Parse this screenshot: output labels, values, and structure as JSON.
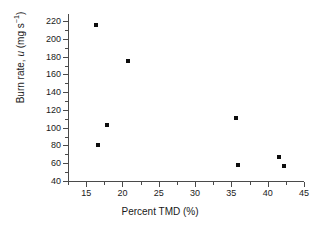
{
  "chart_data": {
    "type": "scatter",
    "title": "",
    "xlabel": "Percent TMD (%)",
    "ylabel": "Burn rate, u (mg s⁻¹)",
    "ylabel_parts": {
      "prefix": "Burn rate, ",
      "variable": "u",
      "units": " (mg s",
      "exponent": "−1",
      "suffix": ")"
    },
    "xlim": [
      12.5,
      45
    ],
    "ylim": [
      40,
      228
    ],
    "grid": false,
    "legend": null,
    "marker": {
      "shape": "square",
      "color": "#0d0d0d",
      "size_px": 4
    },
    "axis_color": "#4a4a4a",
    "background": "#ffffff",
    "xticks": [
      15,
      20,
      25,
      30,
      35,
      40,
      45
    ],
    "xtick_labels": [
      "15",
      "20",
      "25",
      "30",
      "35",
      "40",
      "45"
    ],
    "xminor_ticks": [
      12.5,
      17.5,
      22.5,
      27.5,
      32.5,
      37.5,
      42.5
    ],
    "yticks": [
      40,
      60,
      80,
      100,
      120,
      140,
      160,
      180,
      200,
      220
    ],
    "ytick_labels": [
      "40",
      "60",
      "80",
      "100",
      "120",
      "140",
      "160",
      "180",
      "200",
      "220"
    ],
    "yminor_ticks": [
      50,
      70,
      90,
      110,
      130,
      150,
      170,
      190,
      210
    ],
    "x": [
      16.4,
      16.7,
      17.9,
      20.8,
      35.6,
      35.9,
      41.6,
      42.2
    ],
    "y": [
      216,
      81,
      103,
      175,
      111,
      58,
      67,
      57
    ],
    "points": [
      {
        "x": 16.4,
        "y": 216
      },
      {
        "x": 16.7,
        "y": 81
      },
      {
        "x": 17.9,
        "y": 103
      },
      {
        "x": 20.8,
        "y": 175
      },
      {
        "x": 35.6,
        "y": 111
      },
      {
        "x": 35.9,
        "y": 58
      },
      {
        "x": 41.6,
        "y": 67
      },
      {
        "x": 42.2,
        "y": 57
      }
    ]
  }
}
